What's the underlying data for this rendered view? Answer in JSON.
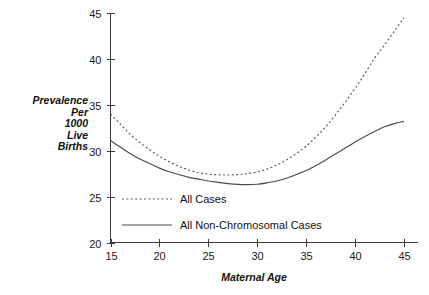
{
  "chart_data": {
    "type": "line",
    "title": "",
    "xlabel": "Maternal Age",
    "ylabel": "Prevalence Per 1000 Live Births",
    "ylabel_lines": [
      "Prevalence",
      "Per",
      "1000",
      "Live",
      "Births"
    ],
    "xlim": [
      15,
      45
    ],
    "ylim": [
      20,
      45
    ],
    "xticks": [
      "15",
      "20",
      "25",
      "30",
      "35",
      "40",
      "45"
    ],
    "yticks": [
      "20",
      "25",
      "30",
      "35",
      "40",
      "45"
    ],
    "grid": false,
    "legend_position": "inside-lower-center",
    "x": [
      15,
      16,
      17,
      18,
      19,
      20,
      21,
      22,
      23,
      24,
      25,
      26,
      27,
      28,
      29,
      30,
      31,
      32,
      33,
      34,
      35,
      36,
      37,
      38,
      39,
      40,
      41,
      42,
      43,
      44,
      45
    ],
    "series": [
      {
        "name": "All Cases",
        "style": "dotted",
        "color": "#5a5a5a",
        "values": [
          34.0,
          32.9,
          31.8,
          30.9,
          30.1,
          29.4,
          28.8,
          28.3,
          27.9,
          27.6,
          27.45,
          27.38,
          27.35,
          27.4,
          27.5,
          27.7,
          28.0,
          28.45,
          29.0,
          29.7,
          30.5,
          31.5,
          32.6,
          33.9,
          35.3,
          36.8,
          38.4,
          40.1,
          41.5,
          43.0,
          44.5
        ]
      },
      {
        "name": "All Non-Chromosomal Cases",
        "style": "solid",
        "color": "#4a4a4a",
        "values": [
          31.1,
          30.4,
          29.7,
          29.1,
          28.6,
          28.1,
          27.7,
          27.4,
          27.1,
          26.9,
          26.7,
          26.55,
          26.42,
          26.33,
          26.3,
          26.35,
          26.5,
          26.7,
          27.0,
          27.4,
          27.85,
          28.4,
          29.0,
          29.65,
          30.3,
          30.95,
          31.55,
          32.1,
          32.6,
          32.95,
          33.2
        ]
      }
    ],
    "legend": [
      {
        "label": "All Cases",
        "style": "dotted"
      },
      {
        "label": "All Non-Chromosomal Cases",
        "style": "solid"
      }
    ]
  }
}
